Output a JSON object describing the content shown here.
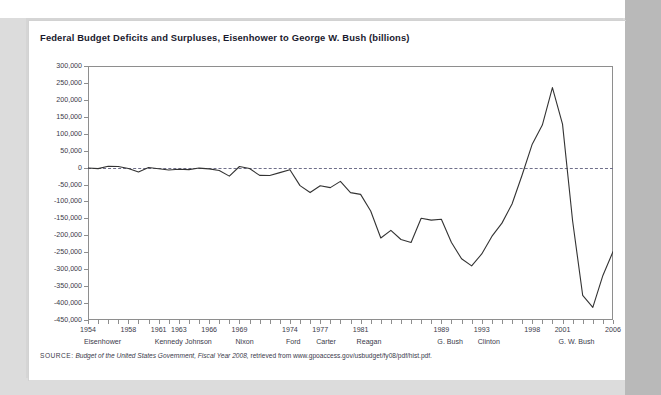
{
  "chart_title": "Federal Budget Deficits and Surpluses, Eisenhower to George W. Bush (billions)",
  "source": {
    "keyword": "SOURCE:",
    "italic_part": "Budget of the United States Government, Fiscal Year 2008,",
    "rest": " retrieved from www.gpoaccess.gov/usbudget/fy08/pdf/hist.pdf."
  },
  "colors": {
    "page_background": "#dcdcdc",
    "right_band": "#b9b9b9",
    "card": "#ffffff",
    "line": "#333333",
    "axis": "#8e8e8e",
    "zero_line": "#6f6f8a",
    "title_text": "#1a1a2e",
    "tick_text": "#3a3a4a"
  },
  "chart_data": {
    "type": "line",
    "title": "Federal Budget Deficits and Surpluses, Eisenhower to George W. Bush (billions)",
    "xlabel": "",
    "ylabel": "",
    "ylim": [
      -450000,
      300000
    ],
    "xlim": [
      1954,
      2006
    ],
    "ytick_step": 50000,
    "grid": false,
    "legend": "none",
    "zero_reference_line": 0,
    "ytick_labels": [
      "300,000",
      "250,000",
      "200,000",
      "150,000",
      "100,000",
      "50,000",
      "0",
      "-50,000",
      "-100,000",
      "-150,000",
      "-200,000",
      "-250,000",
      "-300,000",
      "-350,000",
      "-400,000",
      "-450,000"
    ],
    "ytick_values": [
      300000,
      250000,
      200000,
      150000,
      100000,
      50000,
      0,
      -50000,
      -100000,
      -150000,
      -200000,
      -250000,
      -300000,
      -350000,
      -400000,
      -450000
    ],
    "xtick_labels": [
      {
        "year": 1954,
        "label": "1954"
      },
      {
        "year": 1958,
        "label": "1958"
      },
      {
        "year": 1961,
        "label": "1961"
      },
      {
        "year": 1963,
        "label": "1963"
      },
      {
        "year": 1966,
        "label": "1966"
      },
      {
        "year": 1969,
        "label": "1969"
      },
      {
        "year": 1974,
        "label": "1974"
      },
      {
        "year": 1977,
        "label": "1977"
      },
      {
        "year": 1981,
        "label": "1981"
      },
      {
        "year": 1989,
        "label": "1989"
      },
      {
        "year": 1993,
        "label": "1993"
      },
      {
        "year": 1998,
        "label": "1998"
      },
      {
        "year": 2001,
        "label": "2001"
      },
      {
        "year": 2006,
        "label": "2006"
      }
    ],
    "president_labels": [
      {
        "label": "Eisenhower",
        "year": 1954
      },
      {
        "label": "Kennedy",
        "year": 1961
      },
      {
        "label": "Johnson",
        "year": 1964
      },
      {
        "label": "Nixon",
        "year": 1969
      },
      {
        "label": "Ford",
        "year": 1974
      },
      {
        "label": "Carter",
        "year": 1977
      },
      {
        "label": "Reagan",
        "year": 1981
      },
      {
        "label": "G. Bush",
        "year": 1989
      },
      {
        "label": "Clinton",
        "year": 1993
      },
      {
        "label": "G. W. Bush",
        "year": 2001
      }
    ],
    "x": [
      1954,
      1955,
      1956,
      1957,
      1958,
      1959,
      1960,
      1961,
      1962,
      1963,
      1964,
      1965,
      1966,
      1967,
      1968,
      1969,
      1970,
      1971,
      1972,
      1973,
      1974,
      1975,
      1976,
      1977,
      1978,
      1979,
      1980,
      1981,
      1982,
      1983,
      1984,
      1985,
      1986,
      1987,
      1988,
      1989,
      1990,
      1991,
      1992,
      1993,
      1994,
      1995,
      1996,
      1997,
      1998,
      1999,
      2000,
      2001,
      2002,
      2003,
      2004,
      2005,
      2006
    ],
    "values": [
      -1154,
      -2993,
      3947,
      3412,
      -2769,
      -12849,
      301,
      -3335,
      -7146,
      -4756,
      -5915,
      -1411,
      -3698,
      -8643,
      -25161,
      3242,
      -2842,
      -23033,
      -23373,
      -14908,
      -6135,
      -53242,
      -73732,
      -53659,
      -59186,
      -40729,
      -73830,
      -78968,
      -127977,
      -207802,
      -185367,
      -212308,
      -221227,
      -149730,
      -155178,
      -152639,
      -221036,
      -269238,
      -290321,
      -255051,
      -203186,
      -163952,
      -107431,
      -21884,
      69270,
      125610,
      236241,
      128236,
      -157758,
      -377585,
      -412727,
      -318346,
      -248181
    ],
    "series_name": "Federal budget surplus/deficit",
    "peak_surplus": {
      "year": 2000,
      "value": 236241
    },
    "deepest_deficit": {
      "year": 2004,
      "value": -412727
    }
  }
}
